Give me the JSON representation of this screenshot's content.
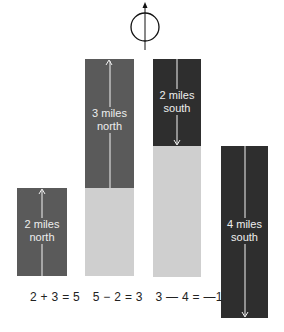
{
  "compass": {
    "icon": "north-arrow-compass-icon"
  },
  "bars": [
    {
      "label_line1": "2 miles",
      "label_line2": "north",
      "direction": "north",
      "miles": 2
    },
    {
      "label_line1": "3 miles",
      "label_line2": "north",
      "direction": "north",
      "miles": 3
    },
    {
      "label_line1": "2 miles",
      "label_line2": "south",
      "direction": "south",
      "miles": 2
    },
    {
      "label_line1": "4 miles",
      "label_line2": "south",
      "direction": "south",
      "miles": 4
    }
  ],
  "equations": [
    "2 + 3 = 5",
    "5 − 2 = 3",
    "3 — 4 = —1"
  ],
  "colors": {
    "north": "#5a5a5a",
    "south": "#2e2e2e",
    "ghost": "#cfcfcf"
  }
}
